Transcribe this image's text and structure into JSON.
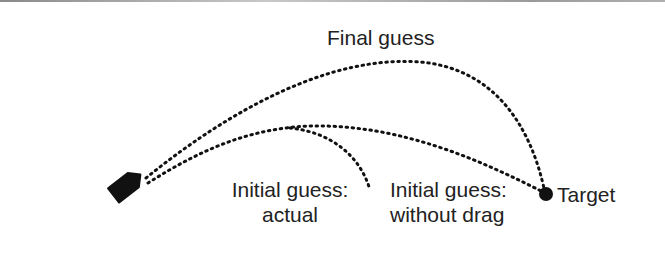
{
  "diagram": {
    "labels": {
      "final_guess": "Final guess",
      "initial_actual_line1": "Initial guess:",
      "initial_actual_line2": "actual",
      "initial_nodrag_line1": "Initial guess:",
      "initial_nodrag_line2": "without drag",
      "target": "Target"
    },
    "colors": {
      "ink": "#111111",
      "text": "#222222",
      "background": "#ffffff"
    },
    "elements": {
      "projectile": "projectile-tag-icon",
      "target_marker": "target-dot-icon"
    },
    "trajectories": [
      {
        "name": "final-guess",
        "style": "dotted",
        "start": [
          145,
          178
        ],
        "peak": [
          410,
          62
        ],
        "end": [
          545,
          193
        ]
      },
      {
        "name": "initial-guess-without-drag",
        "style": "dotted",
        "start": [
          145,
          182
        ],
        "peak": [
          300,
          125
        ],
        "end": [
          545,
          193
        ]
      },
      {
        "name": "initial-guess-actual",
        "style": "dotted",
        "start": [
          145,
          182
        ],
        "peak": [
          290,
          128
        ],
        "end": [
          370,
          190
        ]
      }
    ]
  }
}
